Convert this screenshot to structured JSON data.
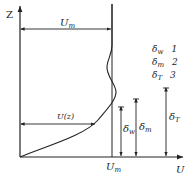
{
  "diagram": {
    "axes": {
      "z_label": "Z",
      "u_label": "U"
    },
    "labels": {
      "um_top": "U",
      "um_top_sub": "m",
      "uz": "U(z)",
      "um_bottom": "U",
      "um_bottom_sub": "m",
      "delta_w": "δ",
      "delta_w_sub": "w",
      "delta_m": "δ",
      "delta_m_sub": "m",
      "delta_t": "δ",
      "delta_t_sub": "T"
    },
    "legend": [
      {
        "symbol": "δ",
        "sub": "w",
        "num": "1"
      },
      {
        "symbol": "δ",
        "sub": "m",
        "num": "2"
      },
      {
        "symbol": "δ",
        "sub": "T",
        "num": "3"
      }
    ],
    "colors": {
      "line": "#222222",
      "background": "#ffffff"
    }
  }
}
